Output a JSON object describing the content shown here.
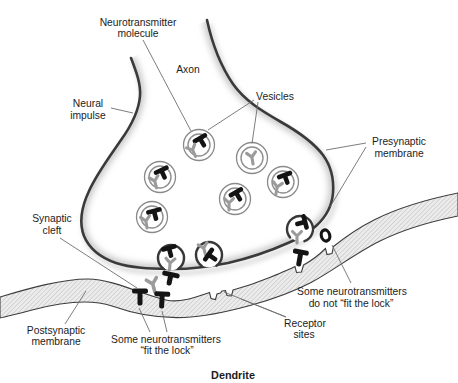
{
  "figure": {
    "type": "biology-diagram"
  },
  "labels": {
    "neurotransmitter_molecule": [
      "Neurotransmitter",
      "molecule"
    ],
    "axon": "Axon",
    "vesicles": "Vesicles",
    "neural_impulse": [
      "Neural",
      "impulse"
    ],
    "presynaptic_membrane": [
      "Presynaptic",
      "membrane"
    ],
    "synaptic_cleft": [
      "Synaptic",
      "cleft"
    ],
    "postsynaptic_membrane": [
      "Postsynaptic",
      "membrane"
    ],
    "fit_the_lock": [
      "Some neurotransmitters",
      "“fit the lock”"
    ],
    "do_not_fit_the_lock": [
      "Some neurotransmitters",
      "do not “fit the lock”"
    ],
    "receptor_sites": [
      "Receptor",
      "sites"
    ],
    "dendrite": "Dendrite"
  },
  "icons": {
    "black_t": "neurotransmitter-T-molecule-icon",
    "gray_y": "neurotransmitter-Y-molecule-icon",
    "ring_o": "neurotransmitter-O-molecule-icon"
  },
  "colors": {
    "outline": "#3a3a3a",
    "membrane_fill": "#ececec",
    "membrane_hatch": "#b0b0b0",
    "vesicle_ring": "#8a8a8a",
    "molecule_black": "#141414",
    "molecule_gray": "#9b9b9b",
    "label_text": "#1c1c1c",
    "leader_line": "#6e6e6e",
    "shading": "#c9c9c9"
  }
}
